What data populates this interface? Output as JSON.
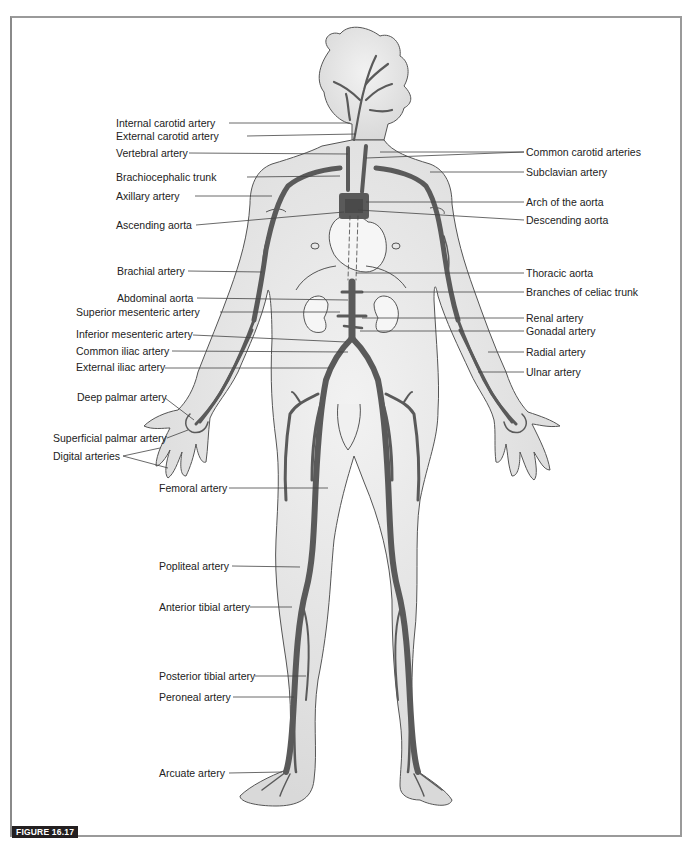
{
  "figure": {
    "tag": "FIGURE 16.17",
    "colors": {
      "body_fill": "#e6e6e6",
      "body_outline": "#555555",
      "artery": "#5a5a5a",
      "leader_line": "#444444",
      "frame": "#9a9a9a",
      "tag_bg": "#231f20"
    }
  },
  "labels_left": [
    {
      "id": "internal-carotid-artery",
      "text": "Internal carotid artery",
      "x": 116,
      "y": 117
    },
    {
      "id": "external-carotid-artery",
      "text": "External carotid artery",
      "x": 116,
      "y": 131
    },
    {
      "id": "vertebral-artery",
      "text": "Vertebral artery",
      "x": 116,
      "y": 148
    },
    {
      "id": "brachiocephalic-trunk",
      "text": "Brachiocephalic trunk",
      "x": 116,
      "y": 171
    },
    {
      "id": "axillary-artery",
      "text": "Axillary artery",
      "x": 116,
      "y": 190
    },
    {
      "id": "ascending-aorta",
      "text": "Ascending aorta",
      "x": 116,
      "y": 219
    },
    {
      "id": "brachial-artery",
      "text": "Brachial artery",
      "x": 117,
      "y": 266
    },
    {
      "id": "abdominal-aorta",
      "text": "Abdominal aorta",
      "x": 117,
      "y": 292
    },
    {
      "id": "superior-mesenteric-artery",
      "text": "Superior mesenteric artery",
      "x": 76,
      "y": 306
    },
    {
      "id": "inferior-mesenteric-artery",
      "text": "Inferior mesenteric artery",
      "x": 76,
      "y": 328
    },
    {
      "id": "common-iliac-artery",
      "text": "Common iliac artery",
      "x": 76,
      "y": 345
    },
    {
      "id": "external-iliac-artery",
      "text": "External iliac artery",
      "x": 76,
      "y": 361
    },
    {
      "id": "deep-palmar-artery",
      "text": "Deep palmar artery",
      "x": 77,
      "y": 391
    },
    {
      "id": "superficial-palmar-artery",
      "text": "Superficial palmar artery",
      "x": 53,
      "y": 433
    },
    {
      "id": "digital-arteries",
      "text": "Digital arteries",
      "x": 53,
      "y": 450
    },
    {
      "id": "femoral-artery",
      "text": "Femoral artery",
      "x": 159,
      "y": 482
    },
    {
      "id": "popliteal-artery",
      "text": "Popliteal artery",
      "x": 159,
      "y": 560
    },
    {
      "id": "anterior-tibial-artery",
      "text": "Anterior tibial artery",
      "x": 159,
      "y": 602
    },
    {
      "id": "posterior-tibial-artery",
      "text": "Posterior tibial artery",
      "x": 159,
      "y": 670
    },
    {
      "id": "peroneal-artery",
      "text": "Peroneal artery",
      "x": 159,
      "y": 691
    },
    {
      "id": "arcuate-artery",
      "text": "Arcuate artery",
      "x": 159,
      "y": 768
    }
  ],
  "labels_right": [
    {
      "id": "common-carotid-arteries",
      "text": "Common carotid arteries",
      "x": 526,
      "y": 147
    },
    {
      "id": "subclavian-artery",
      "text": "Subclavian artery",
      "x": 526,
      "y": 167
    },
    {
      "id": "arch-of-the-aorta",
      "text": "Arch of the aorta",
      "x": 526,
      "y": 197
    },
    {
      "id": "descending-aorta",
      "text": "Descending aorta",
      "x": 526,
      "y": 215
    },
    {
      "id": "thoracic-aorta",
      "text": "Thoracic aorta",
      "x": 526,
      "y": 268
    },
    {
      "id": "branches-of-celiac-trunk",
      "text": "Branches of celiac trunk",
      "x": 526,
      "y": 287
    },
    {
      "id": "renal-artery",
      "text": "Renal artery",
      "x": 526,
      "y": 313
    },
    {
      "id": "gonadal-artery",
      "text": "Gonadal artery",
      "x": 526,
      "y": 326
    },
    {
      "id": "radial-artery",
      "text": "Radial artery",
      "x": 526,
      "y": 347
    },
    {
      "id": "ulnar-artery",
      "text": "Ulnar artery",
      "x": 526,
      "y": 367
    }
  ]
}
